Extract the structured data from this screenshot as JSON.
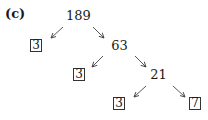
{
  "figure": {
    "label": "(c)",
    "tree": {
      "root": "189",
      "level1": {
        "left_leaf": "3",
        "right_node": "63"
      },
      "level2": {
        "left_leaf": "3",
        "right_node": "21"
      },
      "level3": {
        "left_leaf": "3",
        "right_leaf": "7"
      }
    }
  }
}
